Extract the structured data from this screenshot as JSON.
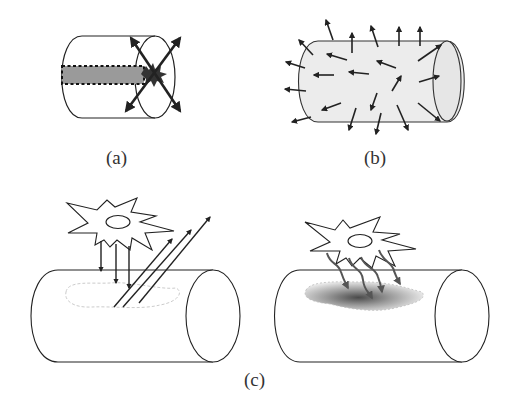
{
  "figure": {
    "panels": [
      {
        "id": "a",
        "label": "(a)",
        "description": "Cylinder with dashed gray channel ending in a dark burst at the end face, double-headed arrows radiating in an X pattern"
      },
      {
        "id": "b",
        "label": "(b)",
        "description": "Shaded cylinder with many single-headed arrows pointing outward and in random directions"
      },
      {
        "id": "c",
        "label": "(c)",
        "description": "Star-shaped cell over cylinder; left: straight arrows down and reflected diagonal arrows; right: wavy arrows into a dark diffuse patch"
      }
    ],
    "colors": {
      "stroke": "#222222",
      "channel_fill": "#9a9a9a",
      "cylinder_fill_b": "#ececec",
      "burst": "#333333",
      "wavy_arrow": "#555555"
    }
  }
}
